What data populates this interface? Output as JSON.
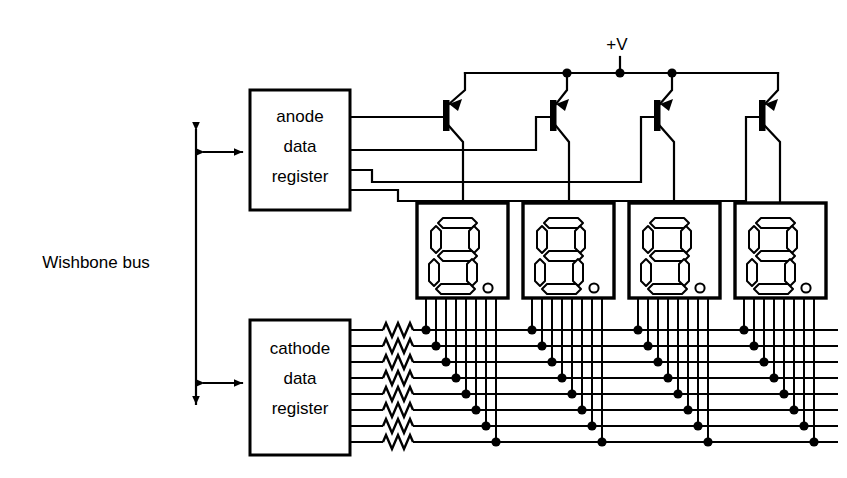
{
  "diagram": {
    "bus": {
      "label": "Wishbone bus",
      "name": "wishbone-bus",
      "orientation": "vertical-double-arrow",
      "x": 196,
      "y_top": 122,
      "y_bottom": 412,
      "label_x": 96,
      "label_y": 262,
      "taps": [
        {
          "name": "anode-bus-tap",
          "y": 152,
          "x_end": 250
        },
        {
          "name": "cathode-bus-tap",
          "y": 383,
          "x_end": 250
        }
      ]
    },
    "power": {
      "label": "+V",
      "name": "power-rail",
      "label_x": 617,
      "label_y": 48,
      "stub_x": 620,
      "stub_y_top": 57,
      "rail_y": 73,
      "rail_x_start": 465,
      "rail_x_end": 778,
      "junction_dots": [
        567,
        620,
        672
      ]
    },
    "blocks": [
      {
        "name": "anode-data-register",
        "lines": [
          "anode",
          "data",
          "register"
        ],
        "x": 250,
        "y": 90,
        "w": 100,
        "h": 120,
        "outputs": [
          117,
          150,
          170,
          190
        ]
      },
      {
        "name": "cathode-data-register",
        "lines": [
          "cathode",
          "data",
          "register"
        ],
        "x": 250,
        "y": 320,
        "w": 100,
        "h": 135,
        "outputs": [
          330,
          346,
          362,
          378,
          394,
          410,
          426,
          442
        ]
      }
    ],
    "transistors": [
      {
        "name": "anode-driver-transistor-1",
        "type": "pnp",
        "bar_x": 446,
        "bar_y": 100,
        "bar_h": 30
      },
      {
        "name": "anode-driver-transistor-2",
        "type": "pnp",
        "bar_x": 553,
        "bar_y": 100,
        "bar_h": 30
      },
      {
        "name": "anode-driver-transistor-3",
        "type": "pnp",
        "bar_x": 657,
        "bar_y": 100,
        "bar_h": 30
      },
      {
        "name": "anode-driver-transistor-4",
        "type": "pnp",
        "bar_x": 762,
        "bar_y": 100,
        "bar_h": 30
      }
    ],
    "displays": [
      {
        "name": "seven-segment-display-1",
        "x": 417,
        "y": 203,
        "w": 91,
        "h": 95,
        "digit": "8",
        "decimal_point": true
      },
      {
        "name": "seven-segment-display-2",
        "x": 523,
        "y": 203,
        "w": 91,
        "h": 95,
        "digit": "8",
        "decimal_point": true
      },
      {
        "name": "seven-segment-display-3",
        "x": 629,
        "y": 203,
        "w": 91,
        "h": 95,
        "digit": "8",
        "decimal_point": true
      },
      {
        "name": "seven-segment-display-4",
        "x": 735,
        "y": 203,
        "w": 91,
        "h": 95,
        "digit": "8",
        "decimal_point": true
      }
    ],
    "cathode_bus": {
      "name": "cathode-bus-lines",
      "count": 8,
      "line_ys": [
        330,
        346,
        362,
        378,
        394,
        410,
        426,
        442
      ],
      "resistor_x_start": 383,
      "resistor_x_end": 413,
      "x_end": 838
    },
    "colors": {
      "ink": "#000000",
      "paper": "#ffffff"
    }
  }
}
